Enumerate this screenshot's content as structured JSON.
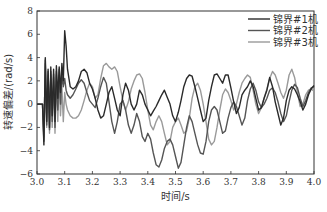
{
  "chart_data": {
    "type": "line",
    "title": "",
    "xlabel": "时间/s",
    "ylabel": "转速偏差/(rad/s)",
    "xlim": [
      3.0,
      4.0
    ],
    "ylim": [
      -6,
      8
    ],
    "xticks": [
      "3.0",
      "3.1",
      "3.2",
      "3.3",
      "3.4",
      "3.5",
      "3.6",
      "3.7",
      "3.8",
      "3.9",
      "4.0"
    ],
    "yticks": [
      "8",
      "6",
      "4",
      "2",
      "0",
      "-2",
      "-4",
      "-6"
    ],
    "grid": false,
    "legend_position": "top-right",
    "series": [
      {
        "name": "锦界#1机",
        "color": "#2a2a2a",
        "x": [
          3.0,
          3.02,
          3.025,
          3.03,
          3.035,
          3.04,
          3.045,
          3.05,
          3.055,
          3.06,
          3.065,
          3.07,
          3.075,
          3.08,
          3.085,
          3.09,
          3.095,
          3.1,
          3.105,
          3.11,
          3.12,
          3.13,
          3.14,
          3.15,
          3.16,
          3.17,
          3.18,
          3.19,
          3.2,
          3.21,
          3.22,
          3.23,
          3.24,
          3.25,
          3.26,
          3.27,
          3.28,
          3.29,
          3.3,
          3.31,
          3.32,
          3.33,
          3.34,
          3.35,
          3.36,
          3.37,
          3.38,
          3.39,
          3.4,
          3.41,
          3.42,
          3.43,
          3.44,
          3.45,
          3.46,
          3.47,
          3.48,
          3.49,
          3.5,
          3.51,
          3.52,
          3.53,
          3.54,
          3.55,
          3.56,
          3.57,
          3.58,
          3.59,
          3.6,
          3.61,
          3.62,
          3.63,
          3.64,
          3.65,
          3.66,
          3.67,
          3.68,
          3.69,
          3.7,
          3.71,
          3.72,
          3.73,
          3.74,
          3.75,
          3.76,
          3.77,
          3.78,
          3.79,
          3.8,
          3.81,
          3.82,
          3.83,
          3.84,
          3.85,
          3.86,
          3.87,
          3.88,
          3.89,
          3.9,
          3.91,
          3.92,
          3.93,
          3.94,
          3.95,
          3.96,
          3.97,
          3.98,
          3.99,
          4.0
        ],
        "values": [
          0,
          0,
          -3.5,
          4,
          -1.5,
          3,
          -2,
          3.2,
          -1,
          3,
          -1.5,
          3.3,
          0.5,
          3.2,
          1,
          3.5,
          2,
          6.3,
          5,
          3,
          1.5,
          1.3,
          1.5,
          2,
          2.8,
          3,
          2.7,
          1.8,
          1.3,
          0.5,
          -0.5,
          -1.2,
          -1,
          0,
          1,
          1.5,
          0.5,
          -0.5,
          -1,
          0.8,
          1.8,
          1.2,
          0,
          -0.5,
          0,
          1.2,
          0.8,
          0,
          -0.5,
          -1,
          -0.6,
          -0.2,
          0.3,
          0.8,
          1.2,
          0.6,
          0,
          -1,
          -1.5,
          -0.7,
          0.3,
          1.5,
          2.2,
          2.5,
          2.4,
          1.5,
          0.5,
          -0.5,
          -1.5,
          -1.2,
          0.3,
          1.5,
          2.5,
          2.6,
          2.2,
          1.8,
          2.5,
          2.5,
          1.4,
          0.2,
          -0.8,
          -0.3,
          0.8,
          1.2,
          1.5,
          2,
          1.5,
          0.5,
          -0.5,
          -0.3,
          0.5,
          1.2,
          2.3,
          1.5,
          0.2,
          -0.8,
          -1.8,
          -1.2,
          0.3,
          1.2,
          1.5,
          1.3,
          0.8,
          0.2,
          -0.5,
          0,
          0.8,
          1.3,
          1.6
        ]
      },
      {
        "name": "锦界#2机",
        "color": "#555555",
        "x": [
          3.0,
          3.02,
          3.025,
          3.03,
          3.035,
          3.04,
          3.045,
          3.05,
          3.055,
          3.06,
          3.065,
          3.07,
          3.075,
          3.08,
          3.085,
          3.09,
          3.095,
          3.1,
          3.105,
          3.11,
          3.12,
          3.13,
          3.14,
          3.15,
          3.16,
          3.17,
          3.18,
          3.19,
          3.2,
          3.21,
          3.22,
          3.23,
          3.24,
          3.25,
          3.26,
          3.27,
          3.28,
          3.29,
          3.3,
          3.31,
          3.32,
          3.33,
          3.34,
          3.35,
          3.36,
          3.37,
          3.38,
          3.39,
          3.4,
          3.41,
          3.42,
          3.43,
          3.44,
          3.45,
          3.46,
          3.47,
          3.48,
          3.49,
          3.5,
          3.51,
          3.52,
          3.53,
          3.54,
          3.55,
          3.56,
          3.57,
          3.58,
          3.59,
          3.6,
          3.61,
          3.62,
          3.63,
          3.64,
          3.65,
          3.66,
          3.67,
          3.68,
          3.69,
          3.7,
          3.71,
          3.72,
          3.73,
          3.74,
          3.75,
          3.76,
          3.77,
          3.78,
          3.79,
          3.8,
          3.81,
          3.82,
          3.83,
          3.84,
          3.85,
          3.86,
          3.87,
          3.88,
          3.89,
          3.9,
          3.91,
          3.92,
          3.93,
          3.94,
          3.95,
          3.96,
          3.97,
          3.98,
          3.99,
          4.0
        ],
        "values": [
          0,
          0,
          -3.2,
          3.8,
          -1.8,
          2.8,
          -2.2,
          2.8,
          -1.5,
          2.6,
          -2,
          2.8,
          -0.5,
          3,
          0,
          2.5,
          1.5,
          2.2,
          1.2,
          0.8,
          0.5,
          0.8,
          1.3,
          1.8,
          2.1,
          1.8,
          1,
          0.3,
          0,
          -0.3,
          0.5,
          1.5,
          2.3,
          1.8,
          0.2,
          -1.5,
          -2.5,
          -1.5,
          0,
          0.3,
          -0.5,
          -1.8,
          -2.5,
          -1.8,
          -0.8,
          -1.5,
          -2.8,
          -3.2,
          -2.5,
          -3,
          -4.2,
          -5.2,
          -5.4,
          -4.8,
          -3.8,
          -3.2,
          -3,
          -3.5,
          -4.5,
          -5.5,
          -5,
          -3.5,
          -2,
          -1,
          -1.5,
          -2.5,
          -3.5,
          -4.2,
          -4.3,
          -3.2,
          -1.5,
          -0.5,
          -0.2,
          -0.5,
          -1.5,
          -2.5,
          -2.3,
          -1.2,
          -0.3,
          0.2,
          -0.2,
          -1,
          -1.8,
          -1.2,
          0.3,
          1.3,
          1.8,
          1.2,
          0.2,
          -0.3,
          0,
          0.5,
          1.2,
          1.4,
          1,
          0.2,
          -0.8,
          -1.5,
          -1,
          0.2,
          1.2,
          1.7,
          1.4,
          0.5,
          -0.2,
          0.3,
          1,
          1.4,
          1.5
        ]
      },
      {
        "name": "锦界#3机",
        "color": "#9a9a9a",
        "x": [
          3.0,
          3.02,
          3.025,
          3.03,
          3.035,
          3.04,
          3.045,
          3.05,
          3.055,
          3.06,
          3.065,
          3.07,
          3.075,
          3.08,
          3.085,
          3.09,
          3.095,
          3.1,
          3.105,
          3.11,
          3.12,
          3.13,
          3.14,
          3.15,
          3.16,
          3.17,
          3.18,
          3.19,
          3.2,
          3.21,
          3.22,
          3.23,
          3.24,
          3.25,
          3.26,
          3.27,
          3.28,
          3.29,
          3.3,
          3.31,
          3.32,
          3.33,
          3.34,
          3.35,
          3.36,
          3.37,
          3.38,
          3.39,
          3.4,
          3.41,
          3.42,
          3.43,
          3.44,
          3.45,
          3.46,
          3.47,
          3.48,
          3.49,
          3.5,
          3.51,
          3.52,
          3.53,
          3.54,
          3.55,
          3.56,
          3.57,
          3.58,
          3.59,
          3.6,
          3.61,
          3.62,
          3.63,
          3.64,
          3.65,
          3.66,
          3.67,
          3.68,
          3.69,
          3.7,
          3.71,
          3.72,
          3.73,
          3.74,
          3.75,
          3.76,
          3.77,
          3.78,
          3.79,
          3.8,
          3.81,
          3.82,
          3.83,
          3.84,
          3.85,
          3.86,
          3.87,
          3.88,
          3.89,
          3.9,
          3.91,
          3.92,
          3.93,
          3.94,
          3.95,
          3.96,
          3.97,
          3.98,
          3.99,
          4.0
        ],
        "values": [
          0,
          0,
          -2.8,
          3.5,
          -2,
          2.5,
          -2.5,
          2.5,
          -2,
          2.3,
          -2.5,
          2.5,
          -1.5,
          2.5,
          -1,
          1.5,
          -1.5,
          1,
          0,
          -0.5,
          -1,
          -1.2,
          -1.2,
          -1,
          -0.5,
          0.3,
          1.2,
          1.8,
          1.5,
          0.5,
          0.8,
          2.2,
          3.3,
          3.5,
          3.2,
          3,
          3.2,
          2.8,
          1.5,
          0.3,
          -0.5,
          0.2,
          1.3,
          2,
          2.5,
          2.6,
          2.2,
          1,
          -0.5,
          -1.8,
          -2.2,
          -1.5,
          -1,
          -1.5,
          -2.5,
          -3.5,
          -3.2,
          -2,
          -1.5,
          -1.2,
          -1.8,
          -2.5,
          -2.3,
          -1.2,
          0.5,
          1.5,
          1.8,
          1.2,
          0,
          -1.5,
          -3,
          -3.5,
          -3.2,
          -2,
          -0.5,
          0.8,
          1.3,
          1,
          0.3,
          -0.5,
          0,
          1,
          1.8,
          2.2,
          2.5,
          2.3,
          1.2,
          0,
          -0.8,
          -0.3,
          0.5,
          1.3,
          2.2,
          2.8,
          2.5,
          1.8,
          1,
          0.5,
          1.2,
          2.5,
          3,
          2.3,
          1,
          -0.2,
          0,
          0.8,
          1.2,
          1.3,
          1.1
        ]
      }
    ]
  }
}
